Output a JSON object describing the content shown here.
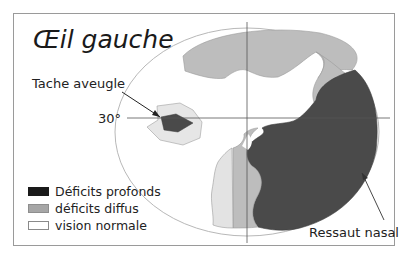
{
  "title": "Œil gauche",
  "labels": {
    "blind_spot": "Tache aveugle",
    "degree_30": "30°",
    "nasal_step": "Ressaut nasal"
  },
  "legend": [
    {
      "label": "Déficits profonds",
      "color": "#1a1a1a",
      "border": "#1a1a1a"
    },
    {
      "label": "déficits diffus",
      "color": "#a6a6a6",
      "border": "#8e8e8e"
    },
    {
      "label": "vision normale",
      "color": "#ffffff",
      "border": "#8a8a8a"
    }
  ],
  "colors": {
    "deep_deficit": "#4a4a4a",
    "diffuse_deficit": "#bdbdbd",
    "light_deficit": "#e3e3e3",
    "field_outline": "#b5b5b5",
    "axis": "#555555",
    "frame": "#9a9a9a"
  }
}
